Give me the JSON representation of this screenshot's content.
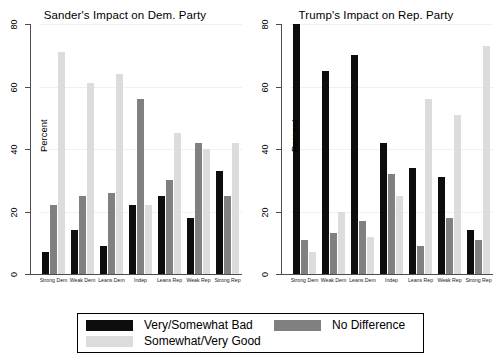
{
  "figure": {
    "background": "#ffffff",
    "legend": {
      "entries": [
        {
          "label": "Very/Somewhat Bad",
          "color": "#0d0d0d",
          "key": "bad"
        },
        {
          "label": "Somewhat/Very Good",
          "color": "#dcdcdc",
          "key": "good"
        },
        {
          "label": "No Difference",
          "color": "#808080",
          "key": "nodiff"
        }
      ]
    }
  },
  "chart_data": [
    {
      "type": "bar",
      "title": "Sander's Impact on Dem. Party",
      "xlabel": "",
      "ylabel": "Percent",
      "ylim": [
        0,
        80
      ],
      "yticks": [
        0,
        20,
        40,
        60,
        80
      ],
      "grid": true,
      "legend_position": "bottom",
      "categories": [
        "Strong Dem",
        "Weak Dem",
        "Leans Dem",
        "Indep",
        "Leans Rep",
        "Weak Rep",
        "Strong Rep"
      ],
      "series": [
        {
          "name": "Very/Somewhat Bad",
          "color": "#0d0d0d",
          "values": [
            7,
            14,
            9,
            22,
            25,
            18,
            33
          ]
        },
        {
          "name": "No Difference",
          "color": "#808080",
          "values": [
            22,
            25,
            26,
            56,
            30,
            42,
            25
          ]
        },
        {
          "name": "Somewhat/Very Good",
          "color": "#dcdcdc",
          "values": [
            71,
            61,
            64,
            22,
            45,
            40,
            42
          ]
        }
      ]
    },
    {
      "type": "bar",
      "title": "Trump's Impact on Rep. Party",
      "xlabel": "",
      "ylabel": "Percent",
      "ylim": [
        0,
        80
      ],
      "yticks": [
        0,
        20,
        40,
        60,
        80
      ],
      "grid": true,
      "legend_position": "bottom",
      "categories": [
        "Strong Dem",
        "Weak Dem",
        "Leans Dem",
        "Indep",
        "Leans Rep",
        "Weak Rep",
        "Strong Rep"
      ],
      "series": [
        {
          "name": "Very/Somewhat Bad",
          "color": "#0d0d0d",
          "values": [
            80,
            65,
            70,
            42,
            34,
            31,
            14
          ]
        },
        {
          "name": "No Difference",
          "color": "#808080",
          "values": [
            11,
            13,
            17,
            32,
            9,
            18,
            11
          ]
        },
        {
          "name": "Somewhat/Very Good",
          "color": "#dcdcdc",
          "values": [
            7,
            20,
            12,
            25,
            56,
            51,
            73
          ]
        }
      ]
    }
  ]
}
